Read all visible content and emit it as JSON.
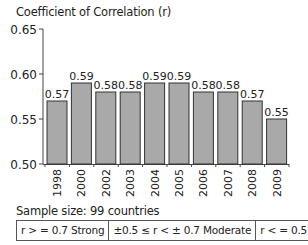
{
  "chart_data": {
    "type": "bar",
    "title": "Coefficient of Correlation (r)",
    "xlabel": "",
    "ylabel": "Coefficient of Correlation (r)",
    "categories": [
      "1998",
      "2000",
      "2002",
      "2003",
      "2004",
      "2005",
      "2006",
      "2007",
      "2008",
      "2009"
    ],
    "values": [
      0.57,
      0.59,
      0.58,
      0.58,
      0.59,
      0.59,
      0.58,
      0.58,
      0.57,
      0.55
    ],
    "value_labels": [
      "0.57",
      "0.59",
      "0.58",
      "0.58",
      "0.59",
      "0.59",
      "0.58",
      "0.58",
      "0.57",
      "0.55"
    ],
    "ylim": [
      0.5,
      0.65
    ],
    "yticks": [
      "0.65",
      "0.60",
      "0.55",
      "0.50"
    ],
    "grid": false,
    "bar_color": "#a9a9a9",
    "bar_edge_color": "#333333"
  },
  "footer": {
    "sample_size": "Sample size: 99 countries"
  },
  "legend": [
    {
      "label": "r > = 0.7 Strong"
    },
    {
      "label": "±0.5 ≤ r < ± 0.7 Moderate"
    },
    {
      "label": "r < = 0.5 Weak"
    }
  ]
}
